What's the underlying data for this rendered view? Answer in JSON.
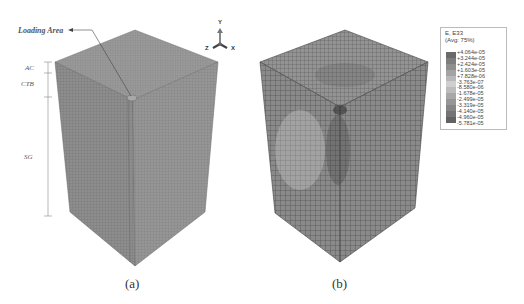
{
  "figure": {
    "panel_a": {
      "caption": "(a)",
      "annotation": "Loading Area",
      "layers": [
        {
          "label": "AC"
        },
        {
          "label": "CTB"
        },
        {
          "label": "SG"
        }
      ]
    },
    "panel_b": {
      "caption": "(b)"
    },
    "axis_triad": {
      "x": "X",
      "y": "Y",
      "z": "Z"
    },
    "legend": {
      "title_line1": "E, E33",
      "title_line2": "(Avg: 75%)",
      "values": [
        "+4.064e-05",
        "+3.244e-05",
        "+2.424e-05",
        "+1.603e-05",
        "+7.828e-06",
        "-3.763e-07",
        "-8.580e-06",
        "-1.678e-05",
        "-2.499e-05",
        "-3.319e-05",
        "-4.140e-05",
        "-4.960e-05",
        "-5.781e-05"
      ],
      "band_colors": [
        "#6a6a6a",
        "#7d7d7d",
        "#8f8f8f",
        "#a3a3a3",
        "#b8b8b8",
        "#cfcfcf",
        "#bcbcbc",
        "#a8a8a8",
        "#969696",
        "#858585",
        "#747474",
        "#626262"
      ]
    }
  }
}
